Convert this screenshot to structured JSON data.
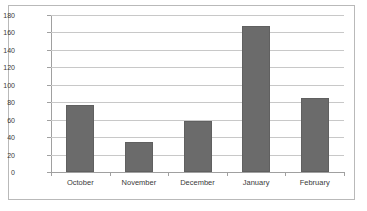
{
  "chart_data": {
    "type": "bar",
    "title": "",
    "subtitle": "",
    "xlabel": "",
    "ylabel": "",
    "categories": [
      "October",
      "November",
      "December",
      "January",
      "February"
    ],
    "values": [
      77,
      34,
      58,
      167,
      85
    ],
    "series": [
      {
        "name": "",
        "values": [
          77,
          34,
          58,
          167,
          85
        ]
      }
    ],
    "ylim": [
      0,
      180
    ],
    "ytick_labels": [
      "0",
      "20",
      "40",
      "60",
      "80",
      "100",
      "120",
      "140",
      "160",
      "180"
    ],
    "ytick_values": [
      0,
      20,
      40,
      60,
      80,
      100,
      120,
      140,
      160,
      180
    ],
    "grid": true,
    "grid_axis": "y",
    "legend": false,
    "legend_position": "none",
    "colors": {
      "bar_fill": "#6b6b6b",
      "bar_border": "#606060",
      "gridline": "#c8c8c8",
      "axis_line": "#a0a0a0",
      "frame_border": "#b9b9b9",
      "plot_background": "#ffffff",
      "tick_label": "#3a3a3a"
    }
  }
}
